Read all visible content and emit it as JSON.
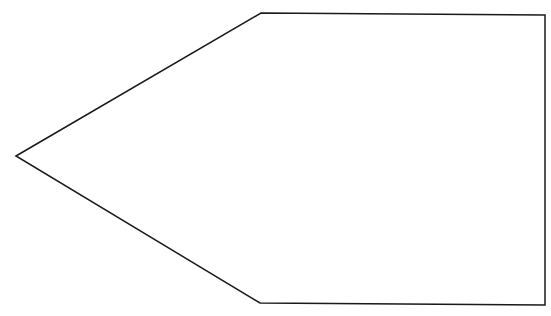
{
  "diagram": {
    "shape": "pentagon",
    "stroke_color": "#1a1a1a",
    "fill_color": "#ffffff",
    "stroke_width": 1.5,
    "points": "16,156 261,13 545,15 545,305 260,303"
  }
}
